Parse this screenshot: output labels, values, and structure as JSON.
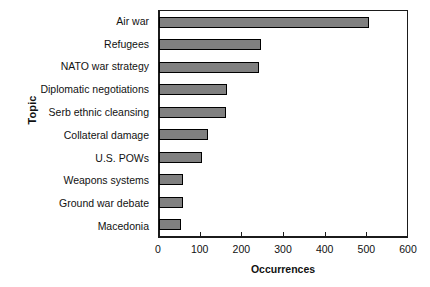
{
  "chart_data": {
    "type": "bar",
    "orientation": "horizontal",
    "title": "",
    "xlabel": "Occurrences",
    "ylabel": "Topic",
    "xlim": [
      0,
      600
    ],
    "xticks": [
      0,
      100,
      200,
      300,
      400,
      500,
      600
    ],
    "xtick_labels": [
      "0",
      "100",
      "200",
      "300",
      "400",
      "500",
      "600"
    ],
    "grid": false,
    "legend": null,
    "bar_color": "#808080",
    "bar_edge_color": "#000000",
    "axis_color": "#1b1b1b",
    "categories": [
      "Air war",
      "Refugees",
      "NATO war strategy",
      "Diplomatic negotiations",
      "Serb ethnic cleansing",
      "Collateral damage",
      "U.S. POWs",
      "Weapons systems",
      "Ground war debate",
      "Macedonia"
    ],
    "values": [
      505,
      245,
      240,
      163,
      160,
      118,
      103,
      58,
      57,
      52
    ]
  }
}
